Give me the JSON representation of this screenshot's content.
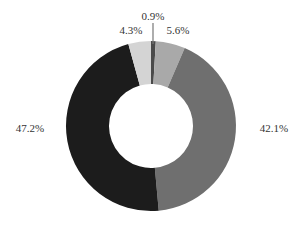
{
  "chart_data": {
    "type": "pie",
    "subtype": "donut",
    "title": "",
    "start_angle_deg": 0,
    "direction": "clockwise",
    "categories": [
      "Segment A",
      "Segment B",
      "Segment C",
      "Segment D",
      "Segment E"
    ],
    "values": [
      0.9,
      5.6,
      42.1,
      47.2,
      4.3
    ],
    "labels": [
      "0.9%",
      "5.6%",
      "42.1%",
      "47.2%",
      "4.3%"
    ],
    "colors": [
      "#4a4a4a",
      "#a9a9a9",
      "#6f6f6f",
      "#1c1c1c",
      "#d4d4d4"
    ],
    "legend": "none",
    "grid": false
  },
  "geometry": {
    "cx": 151,
    "cy": 126,
    "outer_r": 85,
    "inner_r": 42
  }
}
